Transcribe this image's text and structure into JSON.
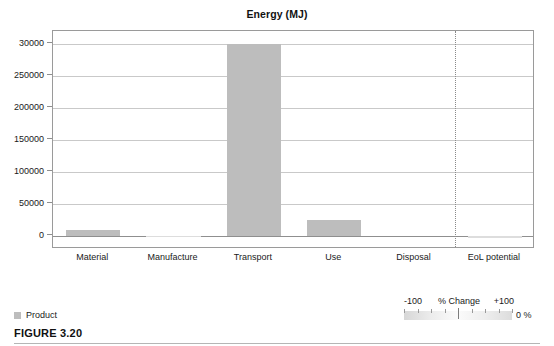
{
  "figure": {
    "caption": "FIGURE 3.20"
  },
  "chart_data": {
    "type": "bar",
    "title": "Energy (MJ)",
    "xlabel": "",
    "ylabel": "",
    "categories": [
      "Material",
      "Manufacture",
      "Transport",
      "Use",
      "Disposal",
      "EoL potential"
    ],
    "series": [
      {
        "name": "Product",
        "values": [
          10000,
          500,
          300000,
          25000,
          0,
          -2000
        ]
      }
    ],
    "ylim": [
      -20000,
      320000
    ],
    "yticks": [
      0,
      50000,
      100000,
      150000,
      200000,
      250000,
      300000
    ],
    "ytick_labels": [
      "0",
      "50000",
      "100000",
      "150000",
      "200000",
      "250000",
      "30000"
    ],
    "grid": true,
    "legend_position": "bottom-left",
    "separator_after_category": "Disposal",
    "colors": {
      "bar": "#bdbdbd",
      "gridline": "#c9c9c9",
      "axis": "#8f8f8f"
    }
  },
  "legend": {
    "items": [
      {
        "label": "Product",
        "color": "#bdbdbd"
      }
    ]
  },
  "pct_scale": {
    "min_label": "-100",
    "title": "% Change",
    "max_label": "+100",
    "value": "0 %"
  }
}
